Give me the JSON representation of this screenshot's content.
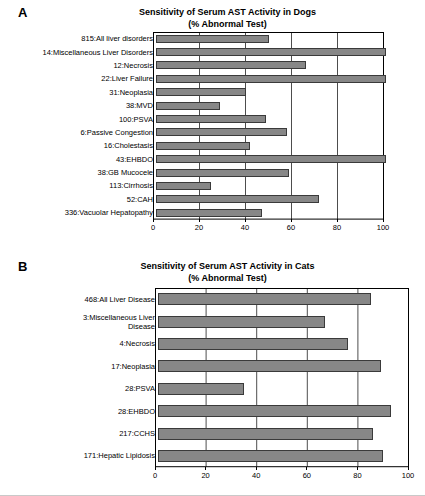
{
  "figure": {
    "panels": [
      {
        "letter": "A",
        "title_line1": "Sensitivity of Serum AST Activity in Dogs",
        "title_line2": "(% Abnormal Test)"
      },
      {
        "letter": "B",
        "title_line1": "Sensitivity of Serum AST Activity in Cats",
        "title_line2": "(% Abnormal Test)"
      }
    ]
  },
  "chart_data": [
    {
      "type": "bar",
      "orientation": "horizontal",
      "panel": "A",
      "title": "Sensitivity of Serum AST Activity in Dogs (% Abnormal Test)",
      "xlabel": "",
      "ylabel": "",
      "xlim": [
        0,
        100
      ],
      "xticks": [
        0,
        20,
        40,
        60,
        80,
        100
      ],
      "grid": "vertical",
      "legend": "none",
      "bar_color": "#878787",
      "bar_edge_color": "#3a3a3a",
      "categories": [
        "815:All liver disorders",
        "14:Miscellaneous Liver Disorders",
        "12:Necrosis",
        "22:Liver Failure",
        "31:Neoplasia",
        "38:MVD",
        "100:PSVA",
        "6:Passive Congestion",
        "16:Cholestasis",
        "43:EHBDO",
        "38:GB Mucocele",
        "113:Cirrhosis",
        "52:CAH",
        "336:Vacuolar Hepatopathy"
      ],
      "values": [
        49,
        100,
        65,
        100,
        39,
        28,
        48,
        57,
        41,
        100,
        58,
        24,
        71,
        46
      ]
    },
    {
      "type": "bar",
      "orientation": "horizontal",
      "panel": "B",
      "title": "Sensitivity of Serum AST Activity in Cats (% Abnormal Test)",
      "xlabel": "",
      "ylabel": "",
      "xlim": [
        0,
        100
      ],
      "xticks": [
        0,
        20,
        40,
        60,
        80,
        100
      ],
      "grid": "vertical",
      "legend": "none",
      "bar_color": "#878787",
      "bar_edge_color": "#3a3a3a",
      "categories": [
        "468:All Liver Disease",
        "3:Miscellaneous Liver\nDisease",
        "4:Necrosis",
        "17:Neoplasia",
        "28:PSVA",
        "28:EHBDO",
        "217:CCHS",
        "171:Hepatic Lipidosis"
      ],
      "values": [
        84,
        66,
        75,
        88,
        34,
        92,
        85,
        89
      ]
    }
  ]
}
